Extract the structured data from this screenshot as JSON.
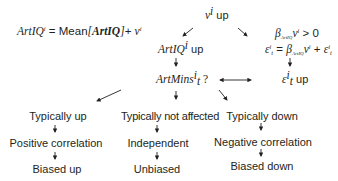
{
  "equation": {
    "lhs": "ArtIQ",
    "lhs_sup": "i",
    "eq": " = ",
    "mean": "Mean",
    "lbr": "[",
    "arg": "ArtIQ",
    "rbr": "]",
    "plus": "+ ",
    "v": "v",
    "v_sup": "i"
  },
  "top": {
    "v": "v",
    "sup": "i",
    "label": " up"
  },
  "center_chain": {
    "artiq": {
      "name": "ArtIQ",
      "sup": "i",
      "label": " up"
    },
    "artmins": {
      "name": "ArtMins",
      "sup": "i",
      "sub": "t",
      "label": " ?"
    }
  },
  "right_chain": {
    "line1": {
      "beta": "β",
      "beta_sub": "ArtIQ",
      "v": "v",
      "v_sup": "i",
      "rest": " > 0"
    },
    "line2": {
      "eps": "ε",
      "eps_sup": "i",
      "eps_sub": "t",
      "eq": " = ",
      "beta": "β",
      "beta_sub": "ArtIQ",
      "v": "v",
      "v_sup": "i",
      "plus": " + ",
      "eps2": "ε",
      "eps2_sup": "i",
      "eps2_sub": "t"
    },
    "line3": {
      "eps": "ε",
      "eps_sup": "i",
      "eps_sub": "t",
      "label": " up"
    }
  },
  "branches": [
    {
      "head": "Typically up",
      "mid": "Positive correlation",
      "tail": "Biased up"
    },
    {
      "head": "Typically not affected",
      "mid": "Independent",
      "tail": "Unbiased"
    },
    {
      "head": "Typically down",
      "mid": "Negative correlation",
      "tail": "Biased down"
    }
  ],
  "colors": {
    "text": "#231f20",
    "background": "#ffffff"
  }
}
